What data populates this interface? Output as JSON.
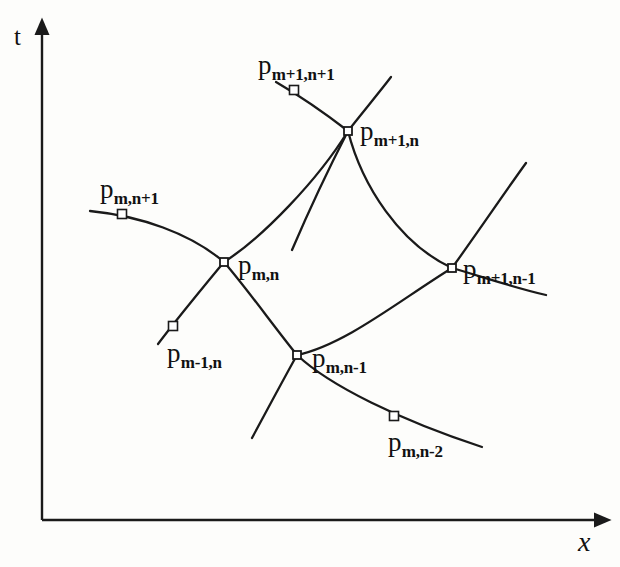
{
  "figure": {
    "kind": "characteristics-grid-diagram",
    "background_color": "#fdfdfb",
    "ink_color": "#1a1a1a"
  },
  "axes": {
    "y_axis": {
      "label": "t",
      "x": 42,
      "top_y": 30,
      "bottom_y": 520
    },
    "x_axis": {
      "label": "x",
      "y": 520,
      "left_x": 42,
      "right_x": 600
    }
  },
  "nodes": [
    {
      "id": "p-m-n",
      "label_base": "p",
      "label_sub": "m,n",
      "x": 224,
      "y": 262,
      "label_x": 238,
      "label_y": 252
    },
    {
      "id": "p-m1-n",
      "label_base": "p",
      "label_sub": "m+1,n",
      "x": 348,
      "y": 131,
      "label_x": 360,
      "label_y": 118
    },
    {
      "id": "p-m-n-1",
      "label_base": "p",
      "label_sub": "m,n-1",
      "x": 297,
      "y": 355,
      "label_x": 312,
      "label_y": 345
    },
    {
      "id": "p-m1-n-1",
      "label_base": "p",
      "label_sub": "m+1,n-1",
      "x": 452,
      "y": 268,
      "label_x": 463,
      "label_y": 256
    }
  ],
  "markers": [
    {
      "id": "p-m-n1",
      "label_base": "p",
      "label_sub": "m,n+1",
      "x": 122,
      "y": 214,
      "label_x": 100,
      "label_y": 176
    },
    {
      "id": "p-m1-n1",
      "label_base": "p",
      "label_sub": "m+1,n+1",
      "x": 294,
      "y": 90,
      "label_x": 258,
      "label_y": 52
    },
    {
      "id": "p-m-1-n",
      "label_base": "p",
      "label_sub": "m-1,n",
      "x": 173,
      "y": 326,
      "label_x": 167,
      "label_y": 340
    },
    {
      "id": "p-m-n-2",
      "label_base": "p",
      "label_sub": "m,n-2",
      "x": 394,
      "y": 416,
      "label_x": 388,
      "label_y": 429
    }
  ],
  "curves": [
    {
      "id": "curve-mn1-to-mn",
      "d": "M 90 211 C 140 216 190 233 224 262"
    },
    {
      "id": "curve-mn-to-m1n",
      "d": "M 224 262 C 262 238 318 180 348 131"
    },
    {
      "id": "curve-m1n1-to-m1n",
      "d": "M 276 82 C 300 96 326 114 348 131"
    },
    {
      "id": "curve-m1n-up-right",
      "d": "M 348 131 C 362 113 378 94 391 77"
    },
    {
      "id": "curve-m1n-to-m1n-1",
      "d": "M 348 131 C 362 186 400 244 452 268"
    },
    {
      "id": "curve-m1n-down-left",
      "d": "M 348 131 C 330 166 310 208 292 250"
    },
    {
      "id": "curve-mn-to-mn-1",
      "d": "M 224 262 C 248 290 275 328 297 355"
    },
    {
      "id": "curve-mn-to-m-1-n",
      "d": "M 224 262 C 205 285 180 315 158 344"
    },
    {
      "id": "curve-mn-1-to-m1n-1",
      "d": "M 297 355 C 345 345 400 300 452 268"
    },
    {
      "id": "curve-mn-1-down-left",
      "d": "M 297 355 C 282 382 266 412 252 438"
    },
    {
      "id": "curve-mn-1-to-mn-2",
      "d": "M 297 355 C 330 386 400 420 482 447"
    },
    {
      "id": "curve-m1n-1-up-right",
      "d": "M 452 268 C 478 232 505 192 526 163"
    },
    {
      "id": "curve-m1n-1-right",
      "d": "M 452 268 C 480 276 515 288 546 295"
    }
  ]
}
